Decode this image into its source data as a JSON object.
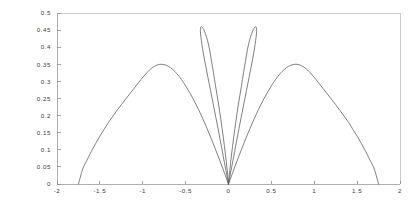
{
  "chart_data": {
    "type": "line",
    "title": "",
    "subtitle": "",
    "xlabel": "",
    "ylabel": "",
    "xlim": [
      -2,
      2
    ],
    "ylim": [
      0,
      0.5
    ],
    "grid": false,
    "legend": null,
    "legend_position": "none",
    "background_color": "#ffffff",
    "line_color": "#555555",
    "axis_color": "#9a9a9a",
    "frame": "box",
    "x_ticks": [
      -2,
      -1.5,
      -1,
      -0.5,
      0,
      0.5,
      1,
      1.5,
      2
    ],
    "x_tick_labels": [
      "-2",
      "-1.5",
      "-1",
      "-0.5",
      "0",
      "0.5",
      "1",
      "1.5",
      "2"
    ],
    "y_ticks": [
      0,
      0.05,
      0.1,
      0.15,
      0.2,
      0.25,
      0.3,
      0.35,
      0.4,
      0.45,
      0.5
    ],
    "y_tick_labels": [
      "0",
      "0.05",
      "0.1",
      "0.15",
      "0.2",
      "0.25",
      "0.3",
      "0.35",
      "0.4",
      "0.45",
      "0.5"
    ],
    "series": [
      {
        "name": "outer-lobe-left",
        "x": [
          -1.75,
          -1.7,
          -1.65,
          -1.6,
          -1.55,
          -1.5,
          -1.45,
          -1.4,
          -1.35,
          -1.3,
          -1.25,
          -1.2,
          -1.15,
          -1.1,
          -1.05,
          -1.0,
          -0.95,
          -0.9,
          -0.85,
          -0.8,
          -0.75,
          -0.7,
          -0.65,
          -0.6,
          -0.55,
          -0.5,
          -0.45,
          -0.4,
          -0.35,
          -0.3,
          -0.25,
          -0.2,
          -0.15,
          -0.1,
          -0.05,
          0.0
        ],
        "y": [
          0.0,
          0.044,
          0.07,
          0.095,
          0.118,
          0.14,
          0.16,
          0.18,
          0.198,
          0.215,
          0.232,
          0.248,
          0.264,
          0.28,
          0.296,
          0.312,
          0.326,
          0.338,
          0.346,
          0.35,
          0.349,
          0.344,
          0.335,
          0.322,
          0.306,
          0.287,
          0.266,
          0.243,
          0.218,
          0.191,
          0.162,
          0.132,
          0.1,
          0.068,
          0.034,
          0.0
        ]
      },
      {
        "name": "outer-lobe-right",
        "x": [
          0.0,
          0.05,
          0.1,
          0.15,
          0.2,
          0.25,
          0.3,
          0.35,
          0.4,
          0.45,
          0.5,
          0.55,
          0.6,
          0.65,
          0.7,
          0.75,
          0.8,
          0.85,
          0.9,
          0.95,
          1.0,
          1.05,
          1.1,
          1.15,
          1.2,
          1.25,
          1.3,
          1.35,
          1.4,
          1.45,
          1.5,
          1.55,
          1.6,
          1.65,
          1.7,
          1.75
        ],
        "y": [
          0.0,
          0.034,
          0.068,
          0.1,
          0.132,
          0.162,
          0.191,
          0.218,
          0.243,
          0.266,
          0.287,
          0.306,
          0.322,
          0.335,
          0.344,
          0.349,
          0.35,
          0.346,
          0.338,
          0.326,
          0.312,
          0.296,
          0.28,
          0.264,
          0.248,
          0.232,
          0.215,
          0.198,
          0.18,
          0.16,
          0.14,
          0.118,
          0.095,
          0.07,
          0.044,
          0.0
        ]
      },
      {
        "name": "inner-lobe-left",
        "x": [
          0.0,
          -0.015,
          -0.035,
          -0.06,
          -0.09,
          -0.12,
          -0.15,
          -0.175,
          -0.2,
          -0.22,
          -0.245,
          -0.27,
          -0.29,
          -0.305,
          -0.318,
          -0.325,
          -0.328,
          -0.322,
          -0.31,
          -0.292,
          -0.268,
          -0.24,
          -0.21,
          -0.18,
          -0.15,
          -0.122,
          -0.096,
          -0.072,
          -0.05,
          -0.03,
          -0.014,
          0.0
        ],
        "y": [
          0.0,
          0.04,
          0.085,
          0.135,
          0.19,
          0.24,
          0.285,
          0.325,
          0.362,
          0.392,
          0.42,
          0.44,
          0.452,
          0.458,
          0.46,
          0.456,
          0.446,
          0.43,
          0.408,
          0.38,
          0.348,
          0.312,
          0.274,
          0.236,
          0.198,
          0.162,
          0.128,
          0.096,
          0.066,
          0.04,
          0.018,
          0.0
        ]
      },
      {
        "name": "inner-lobe-right",
        "x": [
          0.0,
          0.015,
          0.035,
          0.06,
          0.09,
          0.12,
          0.15,
          0.175,
          0.2,
          0.22,
          0.245,
          0.27,
          0.29,
          0.305,
          0.318,
          0.325,
          0.328,
          0.322,
          0.31,
          0.292,
          0.268,
          0.24,
          0.21,
          0.18,
          0.15,
          0.122,
          0.096,
          0.072,
          0.05,
          0.03,
          0.014,
          0.0
        ],
        "y": [
          0.0,
          0.04,
          0.085,
          0.135,
          0.19,
          0.24,
          0.285,
          0.325,
          0.362,
          0.392,
          0.42,
          0.44,
          0.452,
          0.458,
          0.46,
          0.456,
          0.446,
          0.43,
          0.408,
          0.38,
          0.348,
          0.312,
          0.274,
          0.236,
          0.198,
          0.162,
          0.128,
          0.096,
          0.066,
          0.04,
          0.018,
          0.0
        ]
      }
    ],
    "annotations": []
  },
  "plot_geometry": {
    "left": 57,
    "right": 400,
    "top": 13,
    "bottom": 184
  }
}
